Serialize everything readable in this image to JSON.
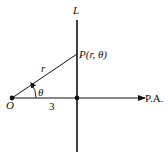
{
  "diagram": {
    "title": "",
    "colors": {
      "stroke": "#111111",
      "background": "#ffffff"
    },
    "labels": {
      "line": "L",
      "point_p": "P(r, θ)",
      "origin": "O",
      "radius": "r",
      "angle": "θ",
      "distance": "3",
      "polar_axis": "P.A."
    },
    "geometry": {
      "origin": [
        12,
        98
      ],
      "point_p": [
        77,
        54
      ],
      "foot": [
        77,
        98
      ],
      "vertical_line_x": 77,
      "vertical_line_y_range": [
        20,
        152
      ],
      "polar_axis_end_x": 145,
      "angle_arc_radius": 24
    }
  }
}
